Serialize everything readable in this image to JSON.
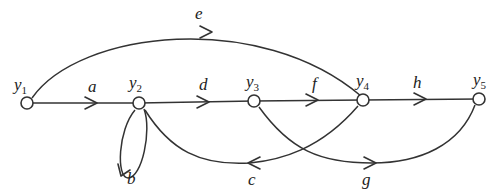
{
  "diagram": {
    "type": "signal-flow-graph",
    "nodes": [
      {
        "id": "y1",
        "base": "y",
        "sub": "1",
        "x": 27,
        "y": 103
      },
      {
        "id": "y2",
        "base": "y",
        "sub": "2",
        "x": 139,
        "y": 103
      },
      {
        "id": "y3",
        "base": "y",
        "sub": "3",
        "x": 254,
        "y": 101
      },
      {
        "id": "y4",
        "base": "y",
        "sub": "4",
        "x": 363,
        "y": 100
      },
      {
        "id": "y5",
        "base": "y",
        "sub": "5",
        "x": 479,
        "y": 99
      }
    ],
    "edges": [
      {
        "from": "y1",
        "to": "y2",
        "gain": "a"
      },
      {
        "from": "y2",
        "to": "y2",
        "gain": "b",
        "kind": "self-loop"
      },
      {
        "from": "y4",
        "to": "y2",
        "gain": "c"
      },
      {
        "from": "y2",
        "to": "y3",
        "gain": "d"
      },
      {
        "from": "y1",
        "to": "y4",
        "gain": "e"
      },
      {
        "from": "y3",
        "to": "y4",
        "gain": "f"
      },
      {
        "from": "y3",
        "to": "y5",
        "gain": "g"
      },
      {
        "from": "y4",
        "to": "y5",
        "gain": "h"
      }
    ]
  },
  "labels": {
    "y1": {
      "base": "y",
      "sub": "1"
    },
    "y2": {
      "base": "y",
      "sub": "2"
    },
    "y3": {
      "base": "y",
      "sub": "3"
    },
    "y4": {
      "base": "y",
      "sub": "4"
    },
    "y5": {
      "base": "y",
      "sub": "5"
    },
    "a": "a",
    "b": "b",
    "c": "c",
    "d": "d",
    "e": "e",
    "f": "f",
    "g": "g",
    "h": "h"
  }
}
